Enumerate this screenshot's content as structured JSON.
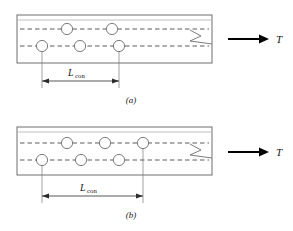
{
  "figure": {
    "panels": [
      {
        "id": "a",
        "caption": "(a)",
        "dimension_label": {
          "symbol": "L",
          "subscript": "con",
          "full": "Lcon"
        },
        "force_label": "T",
        "plate": {
          "x": 17,
          "y": 15,
          "width": 195,
          "height": 48,
          "inner_line_offset": 5
        },
        "gauge_lines": [
          {
            "name": "upper-gauge-line",
            "y": 29
          },
          {
            "name": "lower-gauge-line",
            "y": 46
          }
        ],
        "holes": [
          {
            "row": "upper",
            "cx": 67,
            "cy": 29,
            "r": 5.6,
            "extension": false
          },
          {
            "row": "upper",
            "cx": 112,
            "cy": 29,
            "r": 5.6,
            "extension": false
          },
          {
            "row": "lower",
            "cx": 42,
            "cy": 46,
            "r": 5.6,
            "extension": true
          },
          {
            "row": "lower",
            "cx": 80,
            "cy": 46,
            "r": 5.6,
            "extension": false
          },
          {
            "row": "lower",
            "cx": 119,
            "cy": 46,
            "r": 5.6,
            "extension": true
          }
        ],
        "dimension": {
          "x1": 42,
          "x2": 119,
          "y": 81,
          "text_x": 80,
          "text_y": 76
        },
        "break_symbol_x": 196,
        "force_arrow": {
          "x1": 228,
          "x2": 268,
          "y": 39
        },
        "force_text": {
          "x": 276,
          "y": 42
        },
        "caption_pos": {
          "x": 131,
          "y": 103
        }
      },
      {
        "id": "b",
        "caption": "(b)",
        "dimension_label": {
          "symbol": "L",
          "subscript": "con",
          "full": "Lcon"
        },
        "force_label": "T",
        "plate": {
          "x": 17,
          "y": 127,
          "width": 195,
          "height": 48,
          "inner_line_offset": 5
        },
        "gauge_lines": [
          {
            "name": "upper-gauge-line",
            "y": 143
          },
          {
            "name": "lower-gauge-line",
            "y": 160
          }
        ],
        "holes": [
          {
            "row": "upper",
            "cx": 67,
            "cy": 143,
            "r": 5.6,
            "extension": false
          },
          {
            "row": "upper",
            "cx": 105,
            "cy": 143,
            "r": 5.6,
            "extension": false
          },
          {
            "row": "upper",
            "cx": 143,
            "cy": 143,
            "r": 5.6,
            "extension": true
          },
          {
            "row": "lower",
            "cx": 42,
            "cy": 160,
            "r": 5.6,
            "extension": true
          },
          {
            "row": "lower",
            "cx": 81,
            "cy": 160,
            "r": 5.6,
            "extension": false
          },
          {
            "row": "lower",
            "cx": 119,
            "cy": 160,
            "r": 5.6,
            "extension": false
          }
        ],
        "dimension": {
          "x1": 42,
          "x2": 143,
          "y": 196,
          "text_x": 92,
          "text_y": 191
        },
        "break_symbol_x": 196,
        "force_arrow": {
          "x1": 228,
          "x2": 268,
          "y": 152
        },
        "force_text": {
          "x": 276,
          "y": 155
        },
        "caption_pos": {
          "x": 131,
          "y": 218
        }
      }
    ],
    "colors": {
      "plate_edge": "#6e6e6e",
      "gauge_line": "#4a4a4a",
      "hole_fill": "#ffffff",
      "dimension": "#2b2b2b",
      "force_arrow": "#000000",
      "background": "#ffffff"
    }
  }
}
